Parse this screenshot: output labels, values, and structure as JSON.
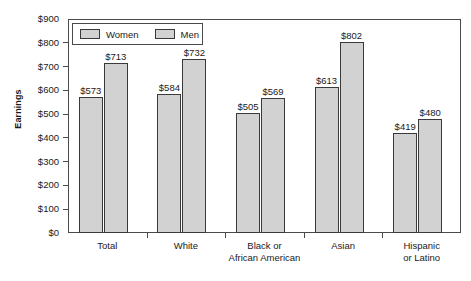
{
  "chart_data": {
    "type": "bar",
    "title": "",
    "xlabel": "",
    "ylabel": "Earnings",
    "ylim": [
      0,
      900
    ],
    "ytick_values": [
      900,
      800,
      700,
      600,
      500,
      400,
      300,
      200,
      100,
      0
    ],
    "ytick_labels": [
      "$900",
      "$800",
      "$700",
      "$600",
      "$500",
      "$400",
      "$300",
      "$200",
      "$100",
      "$0"
    ],
    "grid": false,
    "legend_position": "top-left inside plot",
    "categories": [
      "Total",
      "White",
      "Black or African American",
      "Asian",
      "Hispanic or Latino"
    ],
    "category_lines": [
      [
        "Total"
      ],
      [
        "White"
      ],
      [
        "Black or",
        "African American"
      ],
      [
        "Asian"
      ],
      [
        "Hispanic",
        "or Latino"
      ]
    ],
    "series": [
      {
        "name": "Women",
        "values": [
          573,
          584,
          505,
          613,
          419
        ],
        "labels": [
          "$573",
          "$584",
          "$505",
          "$613",
          "$419"
        ]
      },
      {
        "name": "Men",
        "values": [
          713,
          732,
          569,
          802,
          480
        ],
        "labels": [
          "$713",
          "$732",
          "$569",
          "$802",
          "$480"
        ]
      }
    ],
    "bar_fill_color": "#d2d2d2",
    "bar_edge_color": "#3a3a3a",
    "axis_color": "#4a4a4a",
    "background_color": "#ffffff",
    "text_color": "#1a1a1a"
  },
  "legend": {
    "items": [
      {
        "label": "Women"
      },
      {
        "label": "Men"
      }
    ]
  },
  "axes": {
    "y_title": "Earnings"
  }
}
